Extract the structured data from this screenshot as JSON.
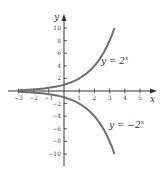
{
  "chart_data": {
    "type": "line",
    "title": "",
    "xlabel": "x",
    "ylabel": "y",
    "xlim": [
      -3,
      5
    ],
    "ylim": [
      -10,
      10
    ],
    "grid": false,
    "x_ticks": [
      -3,
      -2,
      -1,
      1,
      2,
      3,
      4,
      5
    ],
    "y_ticks": [
      -10,
      -8,
      -6,
      -4,
      -2,
      2,
      4,
      6,
      8,
      10
    ],
    "x_tick_labels": [
      "−3",
      "−2",
      "−1",
      "1",
      "2",
      "3",
      "4",
      "5"
    ],
    "y_tick_labels": [
      "−10",
      "−8",
      "−6",
      "−4",
      "−2",
      "2",
      "4",
      "6",
      "8",
      "10"
    ],
    "series": [
      {
        "name": "y = 2^x",
        "label_text": "y = 2",
        "label_sup": "x",
        "function": "2^x",
        "x": [
          -3,
          -2,
          -1,
          0,
          1,
          2,
          3,
          3.32
        ],
        "values": [
          0.125,
          0.25,
          0.5,
          1,
          2,
          4,
          8,
          10
        ]
      },
      {
        "name": "y = -2^x",
        "label_text": "y = −2",
        "label_sup": "x",
        "function": "-2^x",
        "x": [
          -3,
          -2,
          -1,
          0,
          1,
          2,
          3,
          3.32
        ],
        "values": [
          -0.125,
          -0.25,
          -0.5,
          -1,
          -2,
          -4,
          -8,
          -10
        ]
      }
    ],
    "colors": {
      "curve": "#6e6e6e",
      "axis": "#333333"
    }
  }
}
